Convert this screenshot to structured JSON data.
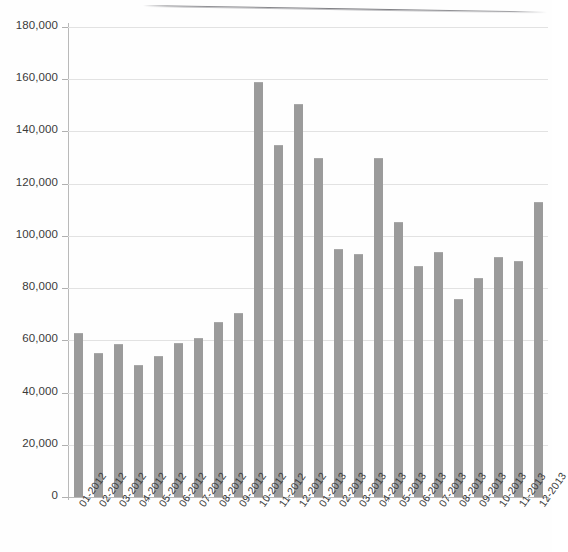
{
  "chart_data": {
    "type": "bar",
    "title": "",
    "subtitle": "",
    "xlabel": "",
    "ylabel": "",
    "grid": true,
    "legend": "none",
    "ylim": [
      0,
      180000
    ],
    "ytick_labels": [
      "180,000",
      "160,000",
      "140,000",
      "120,000",
      "100,000",
      "80,000",
      "60,000",
      "40,000",
      "20,000",
      "0"
    ],
    "ytick_values": [
      180000,
      160000,
      140000,
      120000,
      100000,
      80000,
      60000,
      40000,
      20000,
      0
    ],
    "categories": [
      "01-2012",
      "02-2012",
      "03-2012",
      "04-2012",
      "05-2012",
      "06-2012",
      "07-2012",
      "08-2012",
      "09-2012",
      "10-2012",
      "11-2012",
      "12-2012",
      "01-2013",
      "02-2013",
      "03-2013",
      "04-2013",
      "05-2013",
      "06-2013",
      "07-2013",
      "08-2013",
      "09-2013",
      "10-2013",
      "11-2013",
      "12-2013"
    ],
    "values": [
      63000,
      55000,
      58500,
      50500,
      54000,
      59000,
      61000,
      67000,
      70500,
      159000,
      135000,
      150500,
      130000,
      95000,
      93000,
      130000,
      105500,
      88500,
      94000,
      76000,
      84000,
      92000,
      90500,
      113000
    ],
    "series": [
      {
        "name": "series-1",
        "color": "#9b9b9b",
        "values": [
          63000,
          55000,
          58500,
          50500,
          54000,
          59000,
          61000,
          67000,
          70500,
          159000,
          135000,
          150500,
          130000,
          95000,
          93000,
          130000,
          105500,
          88500,
          94000,
          76000,
          84000,
          92000,
          90500,
          113000
        ]
      }
    ],
    "colors": {
      "bar": "#9b9b9b",
      "grid": "#e2e2e2",
      "axis": "#b9b9b9",
      "text": "#3a3a3a",
      "background": "#ffffff"
    }
  }
}
